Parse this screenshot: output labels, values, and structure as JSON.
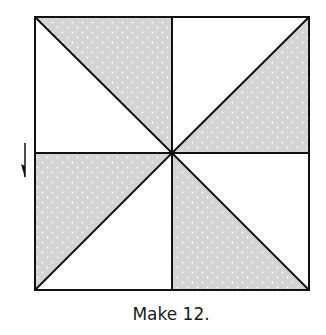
{
  "caption": "Make 12.",
  "colors": {
    "line": "#111111",
    "fill_shaded": "#d4d4d4",
    "fill_dots": "#ffffff",
    "background": "#ffffff"
  },
  "block": {
    "left": 35,
    "top": 17,
    "right": 309,
    "bottom": 290,
    "center_x": 172,
    "center_y": 153,
    "quadrants": [
      {
        "name": "top-left",
        "shaded_triangle": "upper-right"
      },
      {
        "name": "top-right",
        "shaded_triangle": "lower-right"
      },
      {
        "name": "bottom-left",
        "shaded_triangle": "upper-left"
      },
      {
        "name": "bottom-right",
        "shaded_triangle": "lower-left"
      }
    ]
  },
  "arrow": {
    "direction": "down",
    "x": 25,
    "y1": 143,
    "y2": 177
  }
}
